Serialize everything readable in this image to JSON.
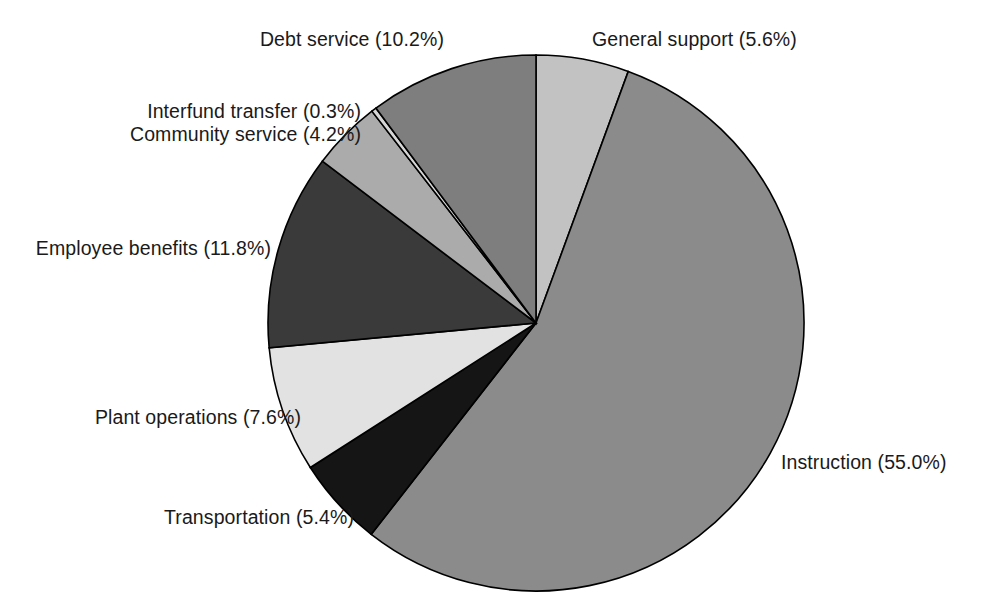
{
  "chart_data": {
    "type": "pie",
    "title": "",
    "subtitle": "",
    "xlabel": "",
    "ylabel": "",
    "legend_position": "none",
    "grid": false,
    "start_angle_deg": 0,
    "direction": "clockwise",
    "units": "percent",
    "categories": [
      "General support",
      "Instruction",
      "Transportation",
      "Plant operations",
      "Employee benefits",
      "Community service",
      "Interfund transfer",
      "Debt service"
    ],
    "values": [
      5.6,
      55.0,
      5.4,
      7.6,
      11.8,
      4.2,
      0.3,
      10.2
    ],
    "total": 100.1,
    "slices": [
      {
        "name": "General support",
        "label": "General support (5.6%)",
        "value": 5.6,
        "color": "#c2c2c2"
      },
      {
        "name": "Instruction",
        "label": "Instruction (55.0%)",
        "value": 55.0,
        "color": "#8b8b8b"
      },
      {
        "name": "Transportation",
        "label": "Transportation (5.4%)",
        "value": 5.4,
        "color": "#151515"
      },
      {
        "name": "Plant operations",
        "label": "Plant operations (7.6%)",
        "value": 7.6,
        "color": "#e2e2e2"
      },
      {
        "name": "Employee benefits",
        "label": "Employee benefits (11.8%)",
        "value": 11.8,
        "color": "#3a3a3a"
      },
      {
        "name": "Community service",
        "label": "Community service (4.2%)",
        "value": 4.2,
        "color": "#ababab"
      },
      {
        "name": "Interfund transfer",
        "label": "Interfund transfer (0.3%)",
        "value": 0.3,
        "color": "#d6d6d6"
      },
      {
        "name": "Debt service",
        "label": "Debt service (10.2%)",
        "value": 10.2,
        "color": "#7e7e7e"
      }
    ]
  },
  "geometry": {
    "center_x": 536,
    "center_y": 323,
    "radius": 268,
    "outline_color": "#000000"
  },
  "labels": {
    "general_support": "General support (5.6%)",
    "debt_service": "Debt service (10.2%)",
    "interfund_transfer": "Interfund transfer (0.3%)",
    "community_service": "Community service (4.2%)",
    "employee_benefits": "Employee benefits (11.8%)",
    "plant_operations": "Plant operations (7.6%)",
    "transportation": "Transportation (5.4%)",
    "instruction": "Instruction (55.0%)"
  }
}
